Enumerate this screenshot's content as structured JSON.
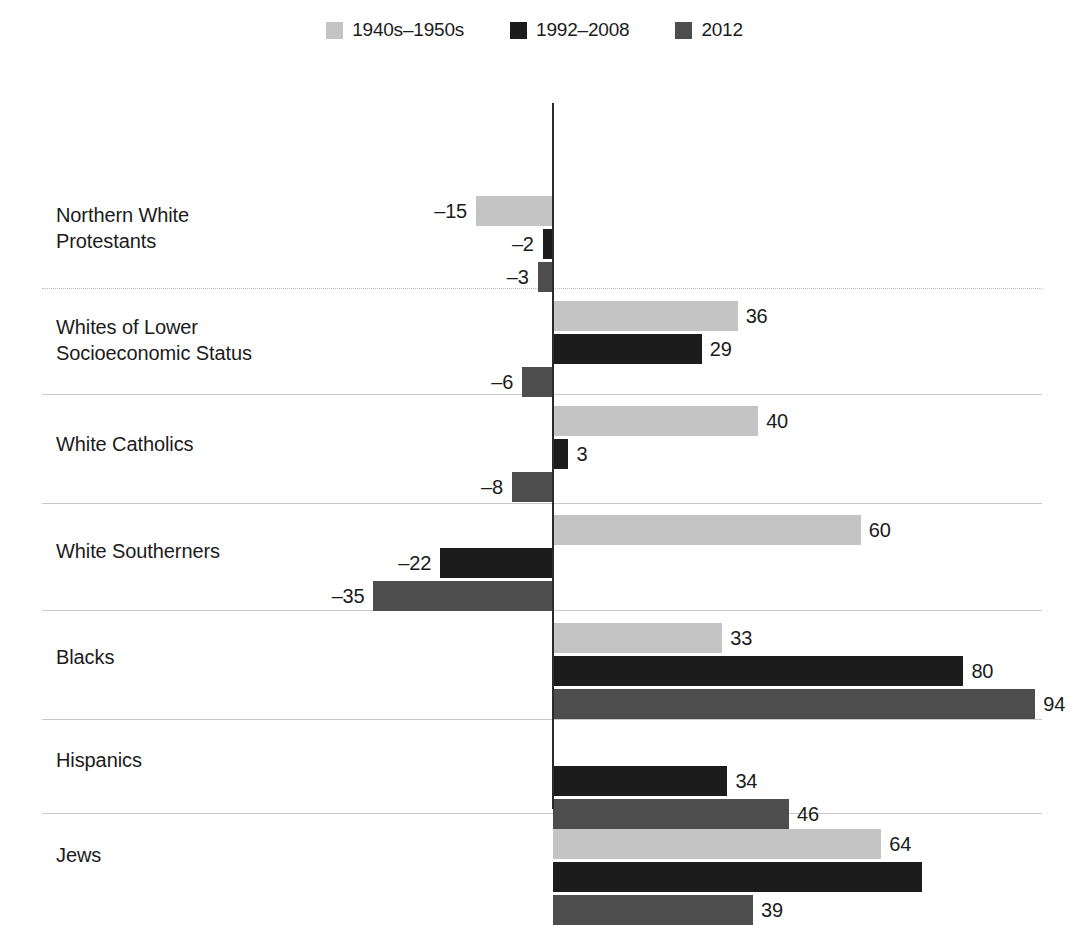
{
  "legend": {
    "entries": [
      {
        "label": "1940s–1950s",
        "color": "#c4c4c4",
        "key": "p1940s_1950s"
      },
      {
        "label": "1992–2008",
        "color": "#1c1c1c",
        "key": "p1992_2008"
      },
      {
        "label": "2012",
        "color": "#4d4d4d",
        "key": "p2012"
      }
    ]
  },
  "axis": {
    "zero_label": "0",
    "zero_line_color": "#2b2b2b"
  },
  "chart_data": {
    "type": "bar",
    "orientation": "horizontal",
    "title": "",
    "subtitle": "",
    "xlabel": "",
    "ylabel": "",
    "grid": false,
    "legend_position": "top-center",
    "xlim": [
      -40,
      100
    ],
    "zero_reference": 0,
    "categories": [
      "Northern White\nProtestants",
      "Whites of Lower\nSocioeconomic Status",
      "White Catholics",
      "White Southerners",
      "Blacks",
      "Hispanics",
      "Jews"
    ],
    "series": [
      {
        "name": "1940s–1950s",
        "color": "#c4c4c4",
        "values": [
          -15,
          36,
          40,
          60,
          33,
          null,
          64
        ],
        "labels": [
          "–15",
          "36",
          "40",
          "60",
          "33",
          "",
          "64"
        ]
      },
      {
        "name": "1992–2008",
        "color": "#1c1c1c",
        "values": [
          -2,
          29,
          3,
          -22,
          80,
          34,
          72
        ],
        "labels": [
          "–2",
          "29",
          "3",
          "–22",
          "80",
          "34",
          ""
        ]
      },
      {
        "name": "2012",
        "color": "#4d4d4d",
        "values": [
          -3,
          -6,
          -8,
          -35,
          94,
          46,
          39
        ],
        "labels": [
          "–3",
          "–6",
          "–8",
          "–35",
          "94",
          "46",
          "39"
        ]
      }
    ]
  }
}
